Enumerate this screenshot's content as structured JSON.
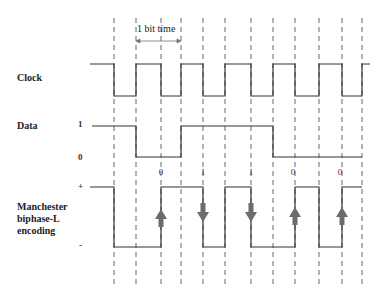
{
  "annotation": {
    "bit_time_label": "1 bit time"
  },
  "rows": {
    "clock": {
      "label": "Clock"
    },
    "data": {
      "label": "Data",
      "level_high": "1",
      "level_low": "0"
    },
    "manchester": {
      "label_lines": [
        "Manchester",
        "biphase-L",
        "encoding"
      ],
      "level_high": "+",
      "level_low": "-"
    }
  },
  "bits": [
    {
      "value": "0",
      "x": 161,
      "arrow": "up"
    },
    {
      "value": "1",
      "x": 203,
      "arrow": "down"
    },
    {
      "value": "1",
      "x": 251,
      "arrow": "down"
    },
    {
      "value": "0",
      "x": 295,
      "arrow": "up"
    },
    {
      "value": "0",
      "x": 342,
      "arrow": "up"
    }
  ],
  "colors": {
    "line": "#333333",
    "dash": "#555555",
    "arrow": "#6b6b6b"
  }
}
